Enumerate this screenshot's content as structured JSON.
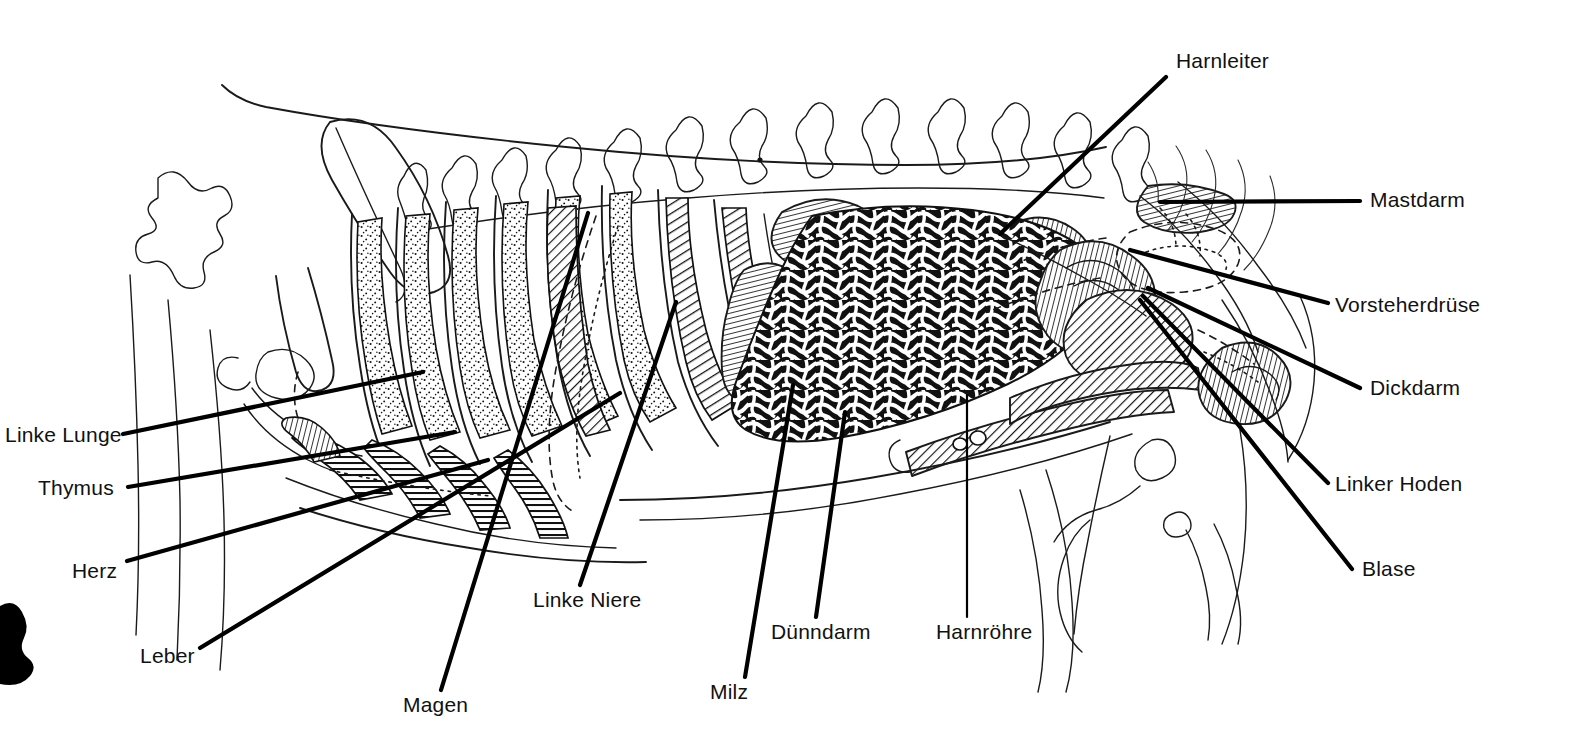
{
  "figure": {
    "kind": "anatomical-diagram",
    "language": "de",
    "style": "schwarzweiss-strichzeichnung",
    "background_color": "#ffffff",
    "ink_color": "#111111",
    "artifact": {
      "name": "ink-blob",
      "description": "schwarzer Druckfleck am linken Bildrand",
      "x": 0,
      "y": 600,
      "width": 34,
      "height": 66
    }
  },
  "labels": [
    {
      "id": "harnleiter",
      "text": "Harnleiter",
      "side": "top-right",
      "text_x": 1176,
      "text_y": 68,
      "anchor": "start",
      "leader": {
        "x1": 1166,
        "y1": 77,
        "x2": 1000,
        "y2": 234
      }
    },
    {
      "id": "mastdarm",
      "text": "Mastdarm",
      "side": "right",
      "text_x": 1370,
      "text_y": 207,
      "anchor": "start",
      "leader": {
        "x1": 1360,
        "y1": 201,
        "x2": 1160,
        "y2": 202
      }
    },
    {
      "id": "vorsteherdruese",
      "text": "Vorsteherdrüse",
      "side": "right",
      "text_x": 1335,
      "text_y": 312,
      "anchor": "start",
      "leader": {
        "x1": 1328,
        "y1": 303,
        "x2": 1130,
        "y2": 250
      }
    },
    {
      "id": "dickdarm",
      "text": "Dickdarm",
      "side": "right",
      "text_x": 1370,
      "text_y": 395,
      "anchor": "start",
      "leader": {
        "x1": 1360,
        "y1": 388,
        "x2": 1148,
        "y2": 288
      }
    },
    {
      "id": "linker-hoden",
      "text": "Linker Hoden",
      "side": "right",
      "text_x": 1335,
      "text_y": 491,
      "anchor": "start",
      "leader": {
        "x1": 1328,
        "y1": 483,
        "x2": 1143,
        "y2": 296
      }
    },
    {
      "id": "blase",
      "text": "Blase",
      "side": "right",
      "text_x": 1362,
      "text_y": 576,
      "anchor": "start",
      "leader": {
        "x1": 1352,
        "y1": 569,
        "x2": 1140,
        "y2": 300
      }
    },
    {
      "id": "linke-lunge",
      "text": "Linke Lunge",
      "side": "left",
      "text_x": 5,
      "text_y": 442,
      "anchor": "start",
      "leader": {
        "x1": 123,
        "y1": 434,
        "x2": 423,
        "y2": 372
      }
    },
    {
      "id": "thymus",
      "text": "Thymus",
      "side": "left",
      "text_x": 38,
      "text_y": 495,
      "anchor": "start",
      "leader": {
        "x1": 128,
        "y1": 487,
        "x2": 455,
        "y2": 432
      }
    },
    {
      "id": "herz",
      "text": "Herz",
      "side": "left",
      "text_x": 72,
      "text_y": 578,
      "anchor": "start",
      "leader": {
        "x1": 127,
        "y1": 561,
        "x2": 488,
        "y2": 460
      }
    },
    {
      "id": "leber",
      "text": "Leber",
      "side": "left",
      "text_x": 140,
      "text_y": 663,
      "anchor": "start",
      "leader": {
        "x1": 200,
        "y1": 648,
        "x2": 620,
        "y2": 393
      }
    },
    {
      "id": "magen",
      "text": "Magen",
      "side": "bottom",
      "text_x": 403,
      "text_y": 712,
      "anchor": "start",
      "leader": {
        "x1": 441,
        "y1": 690,
        "x2": 588,
        "y2": 213
      }
    },
    {
      "id": "linke-niere",
      "text": "Linke Niere",
      "side": "bottom",
      "text_x": 533,
      "text_y": 607,
      "anchor": "start",
      "leader": {
        "x1": 580,
        "y1": 585,
        "x2": 676,
        "y2": 302
      }
    },
    {
      "id": "milz",
      "text": "Milz",
      "side": "bottom",
      "text_x": 710,
      "text_y": 699,
      "anchor": "start",
      "leader": {
        "x1": 745,
        "y1": 677,
        "x2": 793,
        "y2": 385
      }
    },
    {
      "id": "duenndarm",
      "text": "Dünndarm",
      "side": "bottom",
      "text_x": 771,
      "text_y": 639,
      "anchor": "start",
      "leader": {
        "x1": 816,
        "y1": 617,
        "x2": 845,
        "y2": 412
      }
    },
    {
      "id": "harnroehre",
      "text": "Harnröhre",
      "side": "bottom",
      "text_x": 936,
      "text_y": 639,
      "anchor": "start",
      "leader": {
        "x1": 967,
        "y1": 617,
        "x2": 967,
        "y2": 395
      }
    }
  ],
  "organs": [
    {
      "id": "linke-lunge",
      "name": "Linke Lunge",
      "texture": "stipple"
    },
    {
      "id": "thymus",
      "name": "Thymus",
      "texture": "fine-lines"
    },
    {
      "id": "herz",
      "name": "Herz",
      "texture": "horizontal-hatch"
    },
    {
      "id": "leber",
      "name": "Leber",
      "texture": "diagonal-hatch"
    },
    {
      "id": "magen",
      "name": "Magen",
      "texture": "diagonal-hatch"
    },
    {
      "id": "linke-niere",
      "name": "Linke Niere",
      "texture": "fine-lines"
    },
    {
      "id": "milz",
      "name": "Milz",
      "texture": "fine-lines"
    },
    {
      "id": "duenndarm",
      "name": "Dünndarm",
      "texture": "dense-black-coils"
    },
    {
      "id": "dickdarm",
      "name": "Dickdarm",
      "texture": "fine-lines"
    },
    {
      "id": "mastdarm",
      "name": "Mastdarm",
      "texture": "fine-lines"
    },
    {
      "id": "blase",
      "name": "Blase",
      "texture": "fine-lines"
    },
    {
      "id": "harnleiter",
      "name": "Harnleiter",
      "texture": "line"
    },
    {
      "id": "harnroehre",
      "name": "Harnröhre",
      "texture": "diagonal-hatch"
    },
    {
      "id": "vorsteherdruese",
      "name": "Vorsteherdrüse",
      "texture": "dashed-outline"
    },
    {
      "id": "linker-hoden",
      "name": "Linker Hoden",
      "texture": "fine-lines"
    }
  ],
  "skeleton": [
    {
      "id": "scapula",
      "name": "Schulterblatt"
    },
    {
      "id": "ribs",
      "name": "Rippen",
      "count": 13
    },
    {
      "id": "vertebrae",
      "name": "Wirbelsäule"
    },
    {
      "id": "pelvis",
      "name": "Becken"
    },
    {
      "id": "femur",
      "name": "Oberschenkelknochen"
    },
    {
      "id": "sternum",
      "name": "Brustbein"
    }
  ]
}
